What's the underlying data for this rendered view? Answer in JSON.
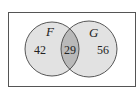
{
  "diagram": {
    "type": "venn",
    "sets": [
      {
        "name": "F",
        "only_count": "42"
      },
      {
        "name": "G",
        "only_count": "56"
      }
    ],
    "intersection": {
      "sets": [
        "F",
        "G"
      ],
      "count": "29"
    },
    "colors": {
      "background": "#ffffff",
      "frame": "#555555",
      "circle_fill": "#e2e2e2",
      "intersection_fill": "#b9b9b9",
      "stroke": "#444444"
    }
  },
  "labels": {
    "set_f": "F",
    "set_g": "G",
    "f_only": "42",
    "intersection": "29",
    "g_only": "56"
  }
}
